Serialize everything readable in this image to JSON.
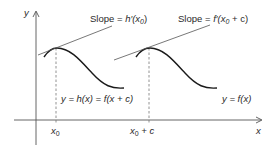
{
  "diagram": {
    "axes": {
      "y_label": "y",
      "x_label": "x"
    },
    "ticks": {
      "x0": "x",
      "x0_sub": "0",
      "x0c_main": "x",
      "x0c_sub": "0",
      "x0c_rest": " + c"
    },
    "slope_labels": {
      "left_prefix": "Slope = ",
      "left_fn": "h′(x",
      "left_sub": "0",
      "left_close": ")",
      "right_prefix": "Slope = ",
      "right_fn": "f′(x",
      "right_sub": "0",
      "right_close": " + c)"
    },
    "curve_labels": {
      "shifted": "y = h(x) = f(x + c)",
      "original": "y = f(x)"
    },
    "colors": {
      "curve": "#1a1a1a",
      "line": "#555555",
      "dashed": "#777777"
    }
  }
}
